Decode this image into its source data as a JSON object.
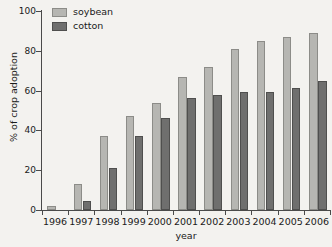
{
  "chart_data": {
    "type": "bar",
    "title": "",
    "xlabel": "year",
    "ylabel": "% of crop adoption",
    "categories": [
      "1996",
      "1997",
      "1998",
      "1999",
      "2000",
      "2001",
      "2002",
      "2003",
      "2004",
      "2005",
      "2006"
    ],
    "series": [
      {
        "name": "soybean",
        "color": "#b6b6b2",
        "values": [
          2,
          13,
          37,
          47,
          54,
          67,
          72,
          81,
          85,
          87,
          89
        ]
      },
      {
        "name": "cotton",
        "color": "#6f6f6e",
        "values": [
          0,
          4.5,
          21,
          37,
          46,
          56.5,
          58,
          59.5,
          59.5,
          61.5,
          65
        ]
      }
    ],
    "ylim": [
      0,
      100
    ],
    "yticks": [
      0,
      20,
      40,
      60,
      80,
      100
    ],
    "ytick_labels": [
      "0",
      "20",
      "40",
      "60",
      "80",
      "100"
    ],
    "grid": false,
    "legend_position": "top-left",
    "legend": [
      "soybean",
      "cotton"
    ]
  },
  "axes": {
    "y_title": "% of crop adoption",
    "x_title": "year"
  },
  "legend": {
    "items": [
      {
        "label": "soybean"
      },
      {
        "label": "cotton"
      }
    ]
  }
}
